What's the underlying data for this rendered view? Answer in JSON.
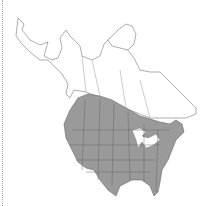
{
  "map": {
    "region": "North America",
    "type": "range-map",
    "colors": {
      "range_fill": "#9a9a9a",
      "range_border": "#666666",
      "land_fill": "#ffffff",
      "land_border": "#777777",
      "frame_edge": "#aaaaaa"
    },
    "legend": []
  }
}
